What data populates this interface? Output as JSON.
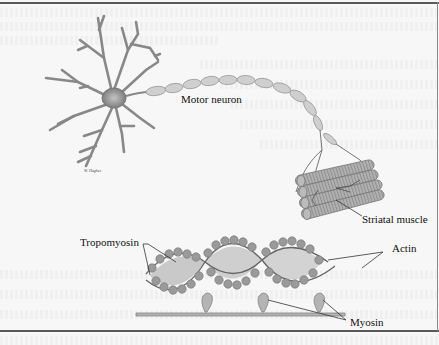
{
  "figure": {
    "top_panel": {
      "title": "Motor neuron innervating striated muscle",
      "labels": {
        "motor_neuron": "Motor neuron",
        "striatal_muscle": "Striatal muscle"
      },
      "artist_signature": "W. Hughes"
    },
    "bottom_panel": {
      "title": "Thin filament and myosin",
      "labels": {
        "tropomyosin": "Tropomyosin",
        "actin": "Actin",
        "myosin": "Myosin"
      }
    },
    "colors": {
      "background": "#f7f7f7",
      "ink": "#111111",
      "neuron_fill": "#8c8c8c",
      "axon_fill": "#c8c8c8",
      "muscle_fill": "#a9a9a9",
      "actin_bead": "#9a9a9a",
      "frame": "#5a5a5a"
    }
  }
}
